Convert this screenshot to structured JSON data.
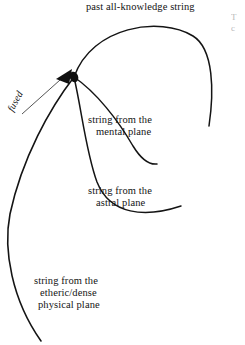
{
  "figure": {
    "kind": "hand-drawn ink diagram",
    "background_color": "#ffffff",
    "ink_color": "#141414",
    "width": 245,
    "height": 345,
    "node": {
      "name": "fusion-node",
      "x": 74,
      "y": 77,
      "description": "filled black dot where all strings converge"
    },
    "arrow": {
      "name": "fused-arrowhead",
      "tip_x": 57,
      "tip_y": 79,
      "direction": "left",
      "points_to": "fusion-node"
    },
    "curves": [
      {
        "name": "past-all-knowledge-string",
        "label_ref": "labels.past_all_knowledge",
        "path": "M74,77 C 92,26 160,16 193,36 C 214,49 214,92 209,126",
        "stroke_width": 1.5
      },
      {
        "name": "mental-plane-string",
        "label_ref": "labels.mental_plane",
        "path": "M74,77 C 96,92 118,120 133,146 C 141,159 149,165 157,164",
        "stroke_width": 1.5
      },
      {
        "name": "astral-plane-string",
        "label_ref": "labels.astral_plane",
        "path": "M74,77 C 82,112 86,152 97,182 C 110,215 145,218 181,206",
        "stroke_width": 1.5
      },
      {
        "name": "etheric-physical-plane-string",
        "label_ref": "labels.physical_plane",
        "path": "M74,77 C 50,108 22,158 10,214 C 3,250 12,300 41,341",
        "stroke_width": 1.6
      }
    ],
    "leader_lines": [
      {
        "name": "fused-leader-line",
        "from_x": 22,
        "from_y": 114,
        "to_x": 60,
        "to_y": 80,
        "stroke_width": 0.8
      }
    ]
  },
  "labels": {
    "past_all_knowledge": "past all-knowledge string",
    "mental_plane": {
      "line1": "string from the",
      "line2": "mental plane"
    },
    "astral_plane": {
      "line1": "string from the",
      "line2": "astral plane"
    },
    "physical_plane": {
      "line1": "string from the",
      "line2": "etheric/dense",
      "line3": "physical plane"
    },
    "fused": "fused",
    "clipped_right_edge": "T\nc"
  }
}
